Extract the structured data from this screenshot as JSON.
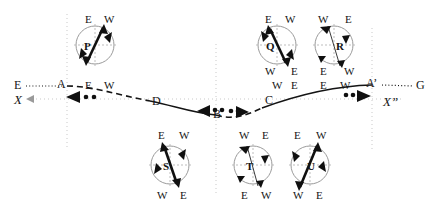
{
  "figure": {
    "type": "wave-particle-motion-diagram",
    "colors": {
      "ink": "#151515",
      "grid": "#c9c9c9",
      "circle_outline": "#8a8a8a",
      "axis_arrow": "#9a9a9a"
    }
  },
  "axis": {
    "left_label": "X",
    "right_label": "X”",
    "left_ray_label": "E",
    "right_ray_label": "G",
    "y": 99
  },
  "wave_nodes": [
    {
      "id": "A",
      "label": "A",
      "x": 67,
      "y": 86
    },
    {
      "id": "D",
      "label": "D",
      "x": 150,
      "y": 100
    },
    {
      "id": "B",
      "label": "B",
      "x": 216,
      "y": 113
    },
    {
      "id": "C",
      "label": "C",
      "x": 287,
      "y": 99
    },
    {
      "id": "Ap",
      "label": "A’",
      "x": 372,
      "y": 85
    }
  ],
  "crest_labels": [
    {
      "text": "E",
      "x": 86,
      "y": 84
    },
    {
      "text": "W",
      "x": 103,
      "y": 84
    },
    {
      "text": "W",
      "x": 277,
      "y": 84
    },
    {
      "text": "E",
      "x": 294,
      "y": 84
    },
    {
      "text": "E",
      "x": 324,
      "y": 84
    },
    {
      "text": "W",
      "x": 342,
      "y": 84
    }
  ],
  "circles": [
    {
      "id": "P",
      "label": "P",
      "cx": 95,
      "cy": 45,
      "r": 19,
      "top_left": "E",
      "top_right": "W",
      "bottom_left": "",
      "bottom_right": "",
      "vector": {
        "x1": 86,
        "y1": 63,
        "x2": 104,
        "y2": 26,
        "style": "bold-double-arrow"
      },
      "tangents": [
        {
          "x": 108,
          "y": 34,
          "rot": 35
        },
        {
          "x": 83,
          "y": 57,
          "rot": 215
        }
      ]
    },
    {
      "id": "Q",
      "label": "Q",
      "cx": 277,
      "cy": 45,
      "r": 19,
      "top_left": "E",
      "top_right": "W",
      "bottom_left": "W",
      "bottom_right": "E",
      "vector": {
        "x1": 287,
        "y1": 65,
        "x2": 269,
        "y2": 27,
        "style": "bold-double-arrow"
      },
      "tangents": [
        {
          "x": 264,
          "y": 35,
          "rot": 215
        },
        {
          "x": 292,
          "y": 58,
          "rot": 35
        }
      ]
    },
    {
      "id": "R",
      "label": "R",
      "cx": 334,
      "cy": 45,
      "r": 19,
      "top_left": "W",
      "top_right": "E",
      "bottom_left": "E",
      "bottom_right": "W",
      "vector": {
        "x1": 339,
        "y1": 66,
        "x2": 328,
        "y2": 26,
        "style": "thin-line"
      },
      "tangents": [
        {
          "x": 323,
          "y": 29,
          "rot": 235
        },
        {
          "x": 349,
          "y": 37,
          "rot": 125
        },
        {
          "x": 320,
          "y": 58,
          "rot": 305
        },
        {
          "x": 343,
          "y": 63,
          "rot": 60
        }
      ]
    },
    {
      "id": "S",
      "label": "S",
      "cx": 170,
      "cy": 165,
      "r": 19,
      "top_left": "E",
      "top_right": "W",
      "bottom_left": "W",
      "bottom_right": "E",
      "vector": {
        "x1": 178,
        "y1": 186,
        "x2": 163,
        "y2": 143,
        "style": "bold-double-arrow"
      },
      "tangents": [
        {
          "x": 184,
          "y": 151,
          "rot": 125
        },
        {
          "x": 157,
          "y": 177,
          "rot": 305
        }
      ]
    },
    {
      "id": "T",
      "label": "T",
      "cx": 253,
      "cy": 165,
      "r": 19,
      "top_left": "W",
      "top_right": "E",
      "bottom_left": "E",
      "bottom_right": "W",
      "vector": {
        "x1": 258,
        "y1": 186,
        "x2": 248,
        "y2": 145,
        "style": "thin-line"
      },
      "tangents": [
        {
          "x": 242,
          "y": 149,
          "rot": 235
        },
        {
          "x": 268,
          "y": 157,
          "rot": 125
        },
        {
          "x": 240,
          "y": 178,
          "rot": 305
        },
        {
          "x": 262,
          "y": 183,
          "rot": 60
        }
      ]
    },
    {
      "id": "U",
      "label": "U",
      "cx": 310,
      "cy": 165,
      "r": 19,
      "top_left": "E",
      "top_right": "W",
      "bottom_left": "W",
      "bottom_right": "E",
      "vector": {
        "x1": 299,
        "y1": 188,
        "x2": 318,
        "y2": 142,
        "style": "bold-double-arrow"
      },
      "tangents": [
        {
          "x": 296,
          "y": 152,
          "rot": 215
        },
        {
          "x": 322,
          "y": 176,
          "rot": 35
        }
      ]
    }
  ],
  "motion_markers": [
    {
      "id": "m1",
      "direction": "left",
      "arrow_x": 73,
      "y": 97,
      "dots_x": [
        82,
        89
      ]
    },
    {
      "id": "m2",
      "direction": "left",
      "arrow_x": 204,
      "y": 111,
      "dots_x": [
        212,
        219
      ]
    },
    {
      "id": "m3",
      "direction": "right",
      "arrow_x": 238,
      "y": 111,
      "dots_x": [
        224,
        231
      ]
    },
    {
      "id": "m4",
      "direction": "right",
      "arrow_x": 363,
      "y": 96,
      "dots_x": [
        348,
        355
      ]
    }
  ],
  "gridlines_x": [
    67,
    216,
    372
  ],
  "legend_note": ""
}
